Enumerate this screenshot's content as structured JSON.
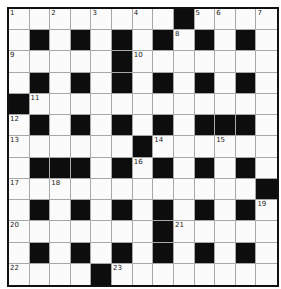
{
  "puzzle": {
    "rows": 13,
    "cols": 13,
    "layout": [
      "1.2.3.4.#56.7",
      ".#.#.#.#8#.#.",
      "9....#A......",
      ".#.#.#.#.#.#.",
      "#B...........",
      "C#.#.#.#.###.",
      "D.....#E..F..",
      ".###.#G#.#.#.",
      "H.I.........#",
      ".#.#.#.#.#.#J",
      "K......#L....",
      ".#.#.#.#.#.#.",
      "M...#N......."
    ],
    "numbers": [
      {
        "n": "1",
        "row": 0,
        "col": 0
      },
      {
        "n": "2",
        "row": 0,
        "col": 2
      },
      {
        "n": "3",
        "row": 0,
        "col": 4
      },
      {
        "n": "4",
        "row": 0,
        "col": 6
      },
      {
        "n": "5",
        "row": 0,
        "col": 9
      },
      {
        "n": "6",
        "row": 0,
        "col": 10
      },
      {
        "n": "7",
        "row": 0,
        "col": 12
      },
      {
        "n": "8",
        "row": 1,
        "col": 8
      },
      {
        "n": "9",
        "row": 2,
        "col": 0
      },
      {
        "n": "10",
        "row": 2,
        "col": 6
      },
      {
        "n": "11",
        "row": 4,
        "col": 1
      },
      {
        "n": "12",
        "row": 5,
        "col": 0
      },
      {
        "n": "13",
        "row": 6,
        "col": 0
      },
      {
        "n": "14",
        "row": 6,
        "col": 7
      },
      {
        "n": "15",
        "row": 6,
        "col": 10
      },
      {
        "n": "16",
        "row": 7,
        "col": 6
      },
      {
        "n": "17",
        "row": 8,
        "col": 0
      },
      {
        "n": "18",
        "row": 8,
        "col": 2
      },
      {
        "n": "19",
        "row": 9,
        "col": 12
      },
      {
        "n": "20",
        "row": 10,
        "col": 0
      },
      {
        "n": "21",
        "row": 10,
        "col": 8
      },
      {
        "n": "22",
        "row": 12,
        "col": 0
      },
      {
        "n": "23",
        "row": 12,
        "col": 5
      }
    ],
    "black_cells": [
      [
        0,
        8
      ],
      [
        1,
        1
      ],
      [
        1,
        3
      ],
      [
        1,
        5
      ],
      [
        1,
        7
      ],
      [
        1,
        9
      ],
      [
        1,
        11
      ],
      [
        2,
        5
      ],
      [
        3,
        1
      ],
      [
        3,
        3
      ],
      [
        3,
        5
      ],
      [
        3,
        7
      ],
      [
        3,
        9
      ],
      [
        3,
        11
      ],
      [
        4,
        0
      ],
      [
        5,
        1
      ],
      [
        5,
        3
      ],
      [
        5,
        5
      ],
      [
        5,
        7
      ],
      [
        5,
        9
      ],
      [
        5,
        10
      ],
      [
        5,
        11
      ],
      [
        6,
        6
      ],
      [
        7,
        1
      ],
      [
        7,
        2
      ],
      [
        7,
        3
      ],
      [
        7,
        5
      ],
      [
        7,
        7
      ],
      [
        7,
        9
      ],
      [
        7,
        11
      ],
      [
        8,
        12
      ],
      [
        9,
        1
      ],
      [
        9,
        3
      ],
      [
        9,
        5
      ],
      [
        9,
        7
      ],
      [
        9,
        9
      ],
      [
        9,
        11
      ],
      [
        10,
        7
      ],
      [
        11,
        1
      ],
      [
        11,
        3
      ],
      [
        11,
        5
      ],
      [
        11,
        7
      ],
      [
        11,
        9
      ],
      [
        11,
        11
      ],
      [
        12,
        4
      ]
    ],
    "colors": {
      "black_cell": "#0d0d0d",
      "white_cell": "#fbfbfb",
      "grid_line": "#a8a8a8",
      "border": "#111111"
    }
  }
}
